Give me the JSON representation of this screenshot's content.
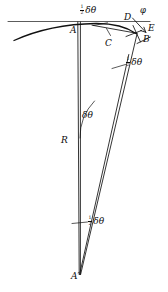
{
  "figure": {
    "width": 168,
    "height": 292,
    "background": "#ffffff",
    "stroke_color": "#1a1a1a",
    "text_color": "#0b0b0b"
  },
  "labels": {
    "point_A": "A",
    "point_B": "B",
    "point_C": "C",
    "point_D": "D",
    "point_E": "E",
    "point_R": "R",
    "point_A_prime": "A′",
    "angle_phi": "φ",
    "angle_delta_theta": "δθ",
    "half_numerator": "1",
    "half_denominator": "2",
    "half_delta_theta_top": "δθ",
    "half_delta_theta_mid": "δθ",
    "half_delta_theta_low": "δθ"
  },
  "geometry": {
    "tangent_line": {
      "x1": 8,
      "y1": 21.5,
      "x2": 150,
      "y2": 21.5
    },
    "arc_path": "M 14 40.5 C 36 30.5, 66 24.0, 96 23.5 C 112 23.4, 126 26.5, 136 33.5",
    "chord_AB_path": "M 92 25.0 L 136 33.0",
    "vertical_axis": {
      "x1": 77.5,
      "y1": 22.0,
      "x2": 80.5,
      "y2": 275.0
    },
    "ray_R_to_B": {
      "x1": 79.0,
      "y1": 274.0,
      "x2": 128.5,
      "y2": 55.0
    },
    "ray_R_to_D_outer": {
      "x1": 80.5,
      "y1": 274.0,
      "x2": 137.0,
      "y2": 33.0
    },
    "tick_B_upper": {
      "x1": 133.5,
      "y1": 26.0,
      "x2": 140.0,
      "y2": 41.5
    },
    "tick_B_lower": {
      "x1": 137.5,
      "y1": 43.0,
      "x2": 150.0,
      "y2": 37.5
    },
    "tick_B_cross": {
      "x1": 126.5,
      "y1": 36.0,
      "x2": 141.0,
      "y2": 31.0
    },
    "arrow_E": {
      "x1": 133.0,
      "y1": 18.5,
      "x2": 146.0,
      "y2": 32.0
    },
    "angle_arc_R": "M 79.5 135.0 A 56 56 0 0 1 92.0 95.5",
    "angle_arc_mid": "M 112.0 66.5 A 16 16 0 0 1 126.5 64.0",
    "angle_arc_low": "M 72.5 223.0 L 86.0 222.0",
    "angle_arc_top": "M 95.0 24.5 L 108.0 23.0"
  },
  "label_positions": {
    "A": {
      "left": 71,
      "top": 27
    },
    "B": {
      "left": 144,
      "top": 36
    },
    "C": {
      "left": 107,
      "top": 40
    },
    "D": {
      "left": 125,
      "top": 14
    },
    "E": {
      "left": 148,
      "top": 25
    },
    "phi": {
      "left": 141,
      "top": 7
    },
    "R": {
      "left": 62,
      "top": 137
    },
    "A_prime": {
      "left": 72,
      "top": 273
    },
    "delta_theta_R": {
      "left": 82,
      "top": 112
    },
    "half_top": {
      "left": 81,
      "top": 6
    },
    "half_mid": {
      "left": 126,
      "top": 57
    },
    "half_low": {
      "left": 89,
      "top": 216
    }
  }
}
